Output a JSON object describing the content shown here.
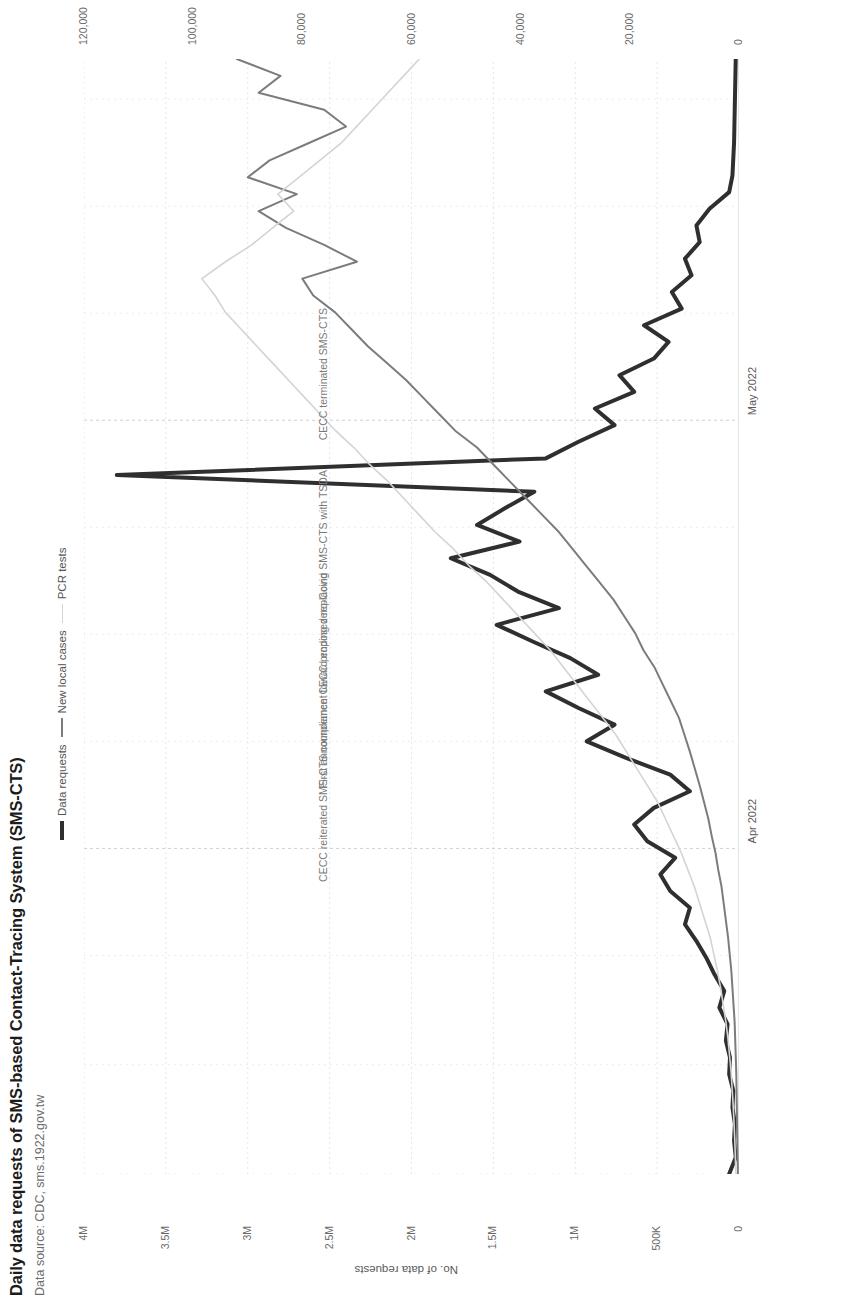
{
  "header": {
    "title": "Daily data requests of SMS-based Contact-Tracing System (SMS-CTS)",
    "subtitle": "Data source: CDC, sms.1922.gov.tw"
  },
  "legend": {
    "items": [
      {
        "label": "Data requests",
        "color": "#2f2f2f"
      },
      {
        "label": "New local cases",
        "color": "#7c7c7c"
      },
      {
        "label": "PCR tests",
        "color": "#d4d4d4"
      }
    ]
  },
  "chart_data": {
    "type": "line",
    "title": "Daily data requests of SMS-based Contact-Tracing System (SMS-CTS)",
    "subtitle": "Data source: CDC, sms.1922.gov.tw",
    "xlabel": "",
    "grid": true,
    "legend_position": "top-right",
    "x_ticks": [
      "Apr 2022",
      "May 2022"
    ],
    "x_tick_positions": [
      0.292,
      0.676
    ],
    "axes": [
      {
        "id": "requests",
        "name": "No. of data requests",
        "side": "left",
        "ticks": [
          "0",
          "500K",
          "1M",
          "1.5M",
          "2M",
          "2.5M",
          "3M",
          "3.5M",
          "4M"
        ],
        "tick_values": [
          0,
          500000,
          1000000,
          1500000,
          2000000,
          2500000,
          3000000,
          3500000,
          4000000
        ],
        "range": [
          0,
          4000000
        ]
      },
      {
        "id": "cases",
        "name": "Local cases",
        "side": "right-inner",
        "ticks": [
          "0",
          "20,000",
          "40,000",
          "60,000",
          "80,000",
          "100,000",
          "120,000"
        ],
        "tick_values": [
          0,
          20000,
          40000,
          60000,
          80000,
          100000,
          120000
        ],
        "range": [
          0,
          120000
        ]
      },
      {
        "id": "pcr",
        "name": "No. of PCR tests",
        "side": "right-outer",
        "ticks": [
          "0",
          "50K",
          "100K",
          "150K",
          "200K",
          "250K"
        ],
        "tick_values": [
          0,
          50000,
          100000,
          150000,
          200000,
          250000
        ],
        "range": [
          0,
          250000
        ]
      }
    ],
    "series": [
      {
        "name": "Data requests",
        "axis": "requests",
        "color": "#2f2f2f",
        "width": 4,
        "values": [
          60000,
          20000,
          30000,
          25000,
          40000,
          35000,
          60000,
          55000,
          80000,
          70000,
          120000,
          90000,
          150000,
          200000,
          260000,
          330000,
          300000,
          420000,
          480000,
          390000,
          560000,
          640000,
          520000,
          300000,
          420000,
          690000,
          930000,
          760000,
          980000,
          1180000,
          860000,
          1030000,
          1260000,
          1480000,
          1100000,
          1350000,
          1520000,
          1760000,
          1340000,
          1600000,
          1430000,
          1250000,
          3800000,
          1180000,
          980000,
          760000,
          880000,
          640000,
          730000,
          520000,
          430000,
          580000,
          350000,
          410000,
          290000,
          330000,
          240000,
          260000,
          180000,
          60000,
          40000,
          35000,
          30000,
          28000,
          26000,
          24000,
          22000,
          20000
        ]
      },
      {
        "name": "New local cases",
        "axis": "cases",
        "color": "#7c7c7c",
        "width": 2,
        "values": [
          200,
          250,
          300,
          350,
          400,
          450,
          500,
          600,
          700,
          800,
          1000,
          1200,
          1400,
          1700,
          2000,
          2400,
          2800,
          3200,
          3800,
          4300,
          5000,
          5600,
          6400,
          7200,
          8100,
          9000,
          10000,
          11000,
          12500,
          14000,
          15500,
          17500,
          19000,
          21000,
          23000,
          25500,
          28000,
          30500,
          33000,
          36000,
          39000,
          42000,
          45000,
          48000,
          52000,
          55000,
          58000,
          61000,
          64500,
          68000,
          71000,
          74000,
          78000,
          80000,
          70000,
          76000,
          83000,
          88000,
          81000,
          90000,
          86000,
          79000,
          72000,
          76000,
          88000,
          84000,
          92000
        ]
      },
      {
        "name": "PCR tests",
        "axis": "pcr",
        "color": "#d4d4d4",
        "width": 1.6,
        "values": [
          1200,
          1400,
          1600,
          1900,
          2200,
          2600,
          3000,
          3600,
          4200,
          5000,
          6000,
          7000,
          8200,
          9600,
          11000,
          13000,
          15000,
          17000,
          19500,
          22000,
          25000,
          28000,
          31000,
          35000,
          39000,
          43000,
          47000,
          52000,
          57000,
          62000,
          67000,
          72000,
          78000,
          84000,
          90000,
          96000,
          103000,
          109000,
          116000,
          122000,
          128000,
          134000,
          141000,
          147000,
          154000,
          160000,
          166000,
          172000,
          178000,
          184000,
          190000,
          196000,
          200000,
          205000,
          196000,
          186000,
          178000,
          170000,
          176000,
          168000,
          160000,
          152000,
          146000,
          140000,
          134000,
          128000,
          122000
        ]
      }
    ],
    "annotations": [
      {
        "text": "CECC reiterated SMS-CTS compliance",
        "x": 0.262,
        "y": 0.355
      },
      {
        "text": "First announcement toward ending zero-Covid",
        "x": 0.346,
        "y": 0.355
      },
      {
        "text": "CECC proposed replacing SMS-CTS with TSDA",
        "x": 0.43,
        "y": 0.355
      },
      {
        "text": "CECC terminated SMS-CTS",
        "x": 0.658,
        "y": 0.355
      }
    ]
  }
}
